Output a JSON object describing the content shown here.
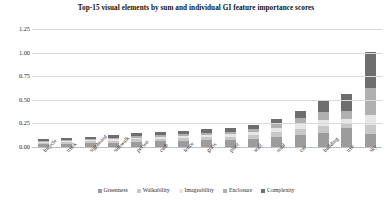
{
  "chart_data": {
    "type": "bar",
    "stacked": true,
    "title": "Top-15 visual elements by sum and individual GI feature importance scores",
    "xlabel": "",
    "ylabel": "",
    "ylim": [
      0.0,
      1.25
    ],
    "yticks": [
      "0.00",
      "0.25",
      "0.50",
      "0.75",
      "1.00",
      "1.25"
    ],
    "grid": true,
    "legend_position": "bottom",
    "categories": [
      "bicycle",
      "truck",
      "signboard",
      "sidewalk",
      "person",
      "curb",
      "fence",
      "grass",
      "plant",
      "wall",
      "road",
      "car",
      "building",
      "tree",
      "sky"
    ],
    "series": [
      {
        "name": "Greenness",
        "color": "#9c9c9c",
        "values": [
          0.03,
          0.035,
          0.04,
          0.045,
          0.055,
          0.06,
          0.065,
          0.07,
          0.075,
          0.085,
          0.11,
          0.13,
          0.15,
          0.2,
          0.135
        ]
      },
      {
        "name": "Walkability",
        "color": "#c8c8c8",
        "values": [
          0.015,
          0.018,
          0.02,
          0.022,
          0.025,
          0.028,
          0.03,
          0.032,
          0.035,
          0.04,
          0.05,
          0.06,
          0.07,
          0.04,
          0.095
        ]
      },
      {
        "name": "Imageability",
        "color": "#e6e6e6",
        "values": [
          0.012,
          0.014,
          0.016,
          0.018,
          0.02,
          0.022,
          0.024,
          0.026,
          0.028,
          0.032,
          0.045,
          0.055,
          0.065,
          0.055,
          0.11
        ]
      },
      {
        "name": "Enclosure",
        "color": "#b0b0b0",
        "values": [
          0.01,
          0.012,
          0.014,
          0.016,
          0.018,
          0.02,
          0.022,
          0.024,
          0.026,
          0.03,
          0.04,
          0.06,
          0.09,
          0.09,
          0.29
        ]
      },
      {
        "name": "Complexity",
        "color": "#6e6e6e",
        "values": [
          0.013,
          0.016,
          0.02,
          0.024,
          0.027,
          0.03,
          0.034,
          0.038,
          0.041,
          0.043,
          0.055,
          0.08,
          0.125,
          0.18,
          0.375
        ]
      }
    ],
    "totals": [
      0.08,
      0.095,
      0.11,
      0.125,
      0.145,
      0.16,
      0.175,
      0.19,
      0.205,
      0.23,
      0.3,
      0.385,
      0.5,
      0.565,
      1.005
    ]
  }
}
